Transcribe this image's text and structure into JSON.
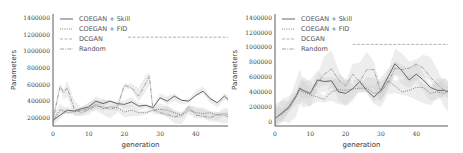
{
  "chart_data": [
    {
      "type": "line",
      "panel": "left",
      "xlabel": "generation",
      "ylabel": "Parameters",
      "xlim": [
        0,
        49
      ],
      "ylim": [
        100000,
        1450000
      ],
      "xticks": [
        "0",
        "10",
        "20",
        "30",
        "40"
      ],
      "yticks": [
        "200000",
        "400000",
        "600000",
        "800000",
        "1000000",
        "1200000",
        "1400000"
      ],
      "legend": [
        "COEGAN + Skill",
        "COEGAN + FID",
        "DCGAN",
        "Random"
      ],
      "legend_position": "upper left",
      "series": [
        {
          "name": "COEGAN + Skill",
          "style": "solid",
          "x": [
            0,
            2,
            4,
            6,
            8,
            10,
            12,
            14,
            16,
            18,
            20,
            22,
            24,
            26,
            28,
            30,
            32,
            34,
            36,
            38,
            40,
            42,
            44,
            46,
            48,
            49
          ],
          "y": [
            170000,
            230000,
            290000,
            280000,
            310000,
            330000,
            400000,
            370000,
            400000,
            370000,
            360000,
            390000,
            340000,
            350000,
            320000,
            440000,
            400000,
            460000,
            410000,
            400000,
            470000,
            520000,
            430000,
            380000,
            460000,
            420000
          ]
        },
        {
          "name": "COEGAN + FID",
          "style": "dotted",
          "x": [
            0,
            2,
            4,
            6,
            8,
            10,
            12,
            14,
            16,
            18,
            20,
            22,
            24,
            26,
            28,
            30,
            32,
            34,
            36,
            38,
            40,
            42,
            44,
            46,
            48,
            49
          ],
          "y": [
            170000,
            300000,
            260000,
            270000,
            290000,
            310000,
            360000,
            310000,
            330000,
            320000,
            270000,
            290000,
            260000,
            260000,
            290000,
            300000,
            290000,
            260000,
            230000,
            290000,
            260000,
            250000,
            260000,
            230000,
            250000,
            240000
          ]
        },
        {
          "name": "DCGAN",
          "style": "dashed",
          "x": [
            21,
            49
          ],
          "y": [
            1170000,
            1170000
          ]
        },
        {
          "name": "Random",
          "style": "dashdot",
          "x": [
            0,
            2,
            3,
            4,
            6,
            8,
            10,
            12,
            14,
            16,
            18,
            20,
            22,
            24,
            26,
            27,
            28,
            30,
            32,
            34,
            36,
            38,
            40,
            42,
            44,
            46,
            48,
            49
          ],
          "y": [
            170000,
            580000,
            500000,
            560000,
            300000,
            260000,
            300000,
            340000,
            330000,
            300000,
            330000,
            590000,
            560000,
            460000,
            620000,
            700000,
            300000,
            260000,
            240000,
            210000,
            230000,
            330000,
            230000,
            220000,
            200000,
            240000,
            230000,
            210000
          ]
        }
      ]
    },
    {
      "type": "line",
      "panel": "right",
      "xlabel": "generation",
      "ylabel": "Parameters",
      "xlim": [
        0,
        49
      ],
      "ylim": [
        0,
        1450000
      ],
      "xticks": [
        "0",
        "10",
        "20",
        "30",
        "40"
      ],
      "yticks": [
        "0",
        "200000",
        "400000",
        "600000",
        "800000",
        "1000000",
        "1200000",
        "1400000"
      ],
      "legend": [
        "COEGAN + Skill",
        "COEGAN + FID",
        "DCGAN",
        "Random"
      ],
      "legend_position": "upper left",
      "series": [
        {
          "name": "COEGAN + Skill",
          "style": "solid",
          "x": [
            0,
            2,
            4,
            6,
            7,
            8,
            10,
            12,
            14,
            16,
            18,
            20,
            22,
            24,
            26,
            28,
            30,
            32,
            34,
            36,
            38,
            40,
            42,
            44,
            46,
            48,
            49
          ],
          "y": [
            40000,
            120000,
            200000,
            350000,
            450000,
            420000,
            380000,
            560000,
            540000,
            550000,
            400000,
            380000,
            440000,
            540000,
            420000,
            330000,
            420000,
            600000,
            780000,
            680000,
            560000,
            640000,
            560000,
            460000,
            420000,
            420000,
            400000
          ]
        },
        {
          "name": "COEGAN + FID",
          "style": "dotted",
          "x": [
            0,
            2,
            4,
            6,
            7,
            8,
            10,
            12,
            14,
            16,
            18,
            20,
            22,
            24,
            26,
            28,
            30,
            32,
            34,
            36,
            38,
            40,
            42,
            44,
            46,
            48,
            49
          ],
          "y": [
            40000,
            100000,
            180000,
            330000,
            420000,
            400000,
            360000,
            330000,
            300000,
            400000,
            430000,
            420000,
            440000,
            450000,
            450000,
            380000,
            400000,
            550000,
            480000,
            400000,
            420000,
            460000,
            460000,
            380000,
            400000,
            380000,
            420000
          ]
        },
        {
          "name": "DCGAN",
          "style": "dashed",
          "x": [
            22,
            49
          ],
          "y": [
            1040000,
            1040000
          ]
        },
        {
          "name": "Random",
          "style": "dashdot",
          "x": [
            0,
            2,
            4,
            6,
            7,
            8,
            10,
            12,
            14,
            16,
            18,
            20,
            22,
            24,
            26,
            28,
            30,
            32,
            34,
            36,
            38,
            40,
            42,
            44,
            46,
            48,
            49
          ],
          "y": [
            40000,
            110000,
            190000,
            340000,
            440000,
            410000,
            380000,
            520000,
            640000,
            710000,
            560000,
            480000,
            640000,
            540000,
            700000,
            700000,
            400000,
            520000,
            720000,
            700000,
            720000,
            770000,
            720000,
            600000,
            500000,
            420000,
            400000
          ]
        }
      ]
    }
  ]
}
